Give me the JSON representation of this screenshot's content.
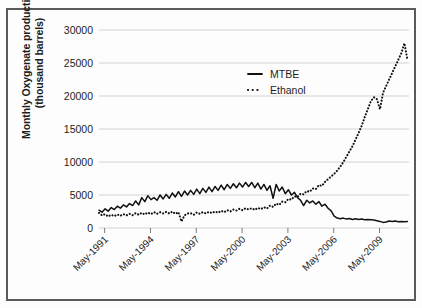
{
  "chart_data": {
    "type": "line",
    "title": "",
    "xlabel": "",
    "ylabel": "Monthly Oxygenate production",
    "ylabel_line2": "(thousand barrels)",
    "ylim": [
      0,
      30000
    ],
    "ytick_labels": [
      "30000",
      "25000",
      "20000",
      "15000",
      "10000",
      "5000",
      "0"
    ],
    "ytick_values": [
      30000,
      25000,
      20000,
      15000,
      10000,
      5000,
      0
    ],
    "xtick_labels": [
      "May-1991",
      "May-1994",
      "May-1997",
      "May-2000",
      "May-2003",
      "May-2006",
      "May-2009"
    ],
    "xtick_values": [
      1991.37,
      1994.37,
      1997.37,
      2000.37,
      2003.37,
      2006.37,
      2009.37
    ],
    "xlim": [
      1991.0,
      2011.3
    ],
    "grid": "horizontal",
    "legend_position": "top-center-right",
    "legend": [
      {
        "name": "MTBE",
        "style": "solid"
      },
      {
        "name": "Ethanol",
        "style": "dotted"
      }
    ],
    "series": [
      {
        "name": "MTBE",
        "style": "solid",
        "color": "#111111",
        "x": [
          1991.0,
          1991.2,
          1991.4,
          1991.6,
          1991.8,
          1992.0,
          1992.2,
          1992.4,
          1992.6,
          1992.8,
          1993.0,
          1993.2,
          1993.4,
          1993.6,
          1993.8,
          1994.0,
          1994.2,
          1994.4,
          1994.6,
          1994.8,
          1995.0,
          1995.2,
          1995.4,
          1995.6,
          1995.8,
          1996.0,
          1996.2,
          1996.4,
          1996.6,
          1996.8,
          1997.0,
          1997.2,
          1997.4,
          1997.6,
          1997.8,
          1998.0,
          1998.2,
          1998.4,
          1998.6,
          1998.8,
          1999.0,
          1999.2,
          1999.4,
          1999.6,
          1999.8,
          2000.0,
          2000.2,
          2000.4,
          2000.6,
          2000.8,
          2001.0,
          2001.2,
          2001.4,
          2001.6,
          2001.8,
          2002.0,
          2002.2,
          2002.4,
          2002.6,
          2002.8,
          2003.0,
          2003.2,
          2003.4,
          2003.6,
          2003.8,
          2004.0,
          2004.2,
          2004.4,
          2004.6,
          2004.8,
          2005.0,
          2005.2,
          2005.4,
          2005.6,
          2005.8,
          2006.0,
          2006.2,
          2006.4,
          2006.6,
          2006.8,
          2007.0,
          2007.2,
          2007.4,
          2007.6,
          2007.8,
          2008.0,
          2008.2,
          2008.4,
          2008.6,
          2008.8,
          2009.0,
          2009.2,
          2009.4,
          2009.6,
          2009.8,
          2010.0,
          2010.2,
          2010.4,
          2010.6,
          2010.8,
          2011.0,
          2011.2
        ],
        "values": [
          2700,
          2400,
          2900,
          2550,
          3100,
          2800,
          3300,
          3000,
          3500,
          3200,
          3700,
          3400,
          4100,
          3500,
          4600,
          4000,
          4900,
          4300,
          4600,
          4200,
          5000,
          4400,
          5100,
          4500,
          5300,
          4700,
          5500,
          4800,
          5600,
          5000,
          5700,
          5100,
          5900,
          5200,
          6000,
          5400,
          6200,
          5500,
          6300,
          5700,
          6500,
          5800,
          6600,
          6000,
          6700,
          6100,
          6800,
          6200,
          6900,
          6300,
          6900,
          6100,
          6800,
          5900,
          6600,
          5700,
          6400,
          4500,
          6600,
          5600,
          6200,
          5200,
          5800,
          5000,
          5400,
          4600,
          4200,
          3400,
          4200,
          3800,
          4100,
          3600,
          4000,
          3300,
          3600,
          3000,
          2600,
          1800,
          1500,
          1400,
          1500,
          1350,
          1450,
          1300,
          1400,
          1300,
          1350,
          1250,
          1300,
          1250,
          1200,
          1100,
          1000,
          850,
          900,
          1050,
          1000,
          1050,
          950,
          1000,
          950,
          1000
        ]
      },
      {
        "name": "Ethanol",
        "style": "dotted",
        "color": "#111111",
        "x": [
          1991.0,
          1991.2,
          1991.4,
          1991.6,
          1991.8,
          1992.0,
          1992.2,
          1992.4,
          1992.6,
          1992.8,
          1993.0,
          1993.2,
          1993.4,
          1993.6,
          1993.8,
          1994.0,
          1994.2,
          1994.4,
          1994.6,
          1994.8,
          1995.0,
          1995.2,
          1995.4,
          1995.6,
          1995.8,
          1996.0,
          1996.2,
          1996.4,
          1996.6,
          1996.8,
          1997.0,
          1997.2,
          1997.4,
          1997.6,
          1997.8,
          1998.0,
          1998.2,
          1998.4,
          1998.6,
          1998.8,
          1999.0,
          1999.2,
          1999.4,
          1999.6,
          1999.8,
          2000.0,
          2000.2,
          2000.4,
          2000.6,
          2000.8,
          2001.0,
          2001.2,
          2001.4,
          2001.6,
          2001.8,
          2002.0,
          2002.2,
          2002.4,
          2002.6,
          2002.8,
          2003.0,
          2003.2,
          2003.4,
          2003.6,
          2003.8,
          2004.0,
          2004.2,
          2004.4,
          2004.6,
          2004.8,
          2005.0,
          2005.2,
          2005.4,
          2005.6,
          2005.8,
          2006.0,
          2006.2,
          2006.4,
          2006.6,
          2006.8,
          2007.0,
          2007.2,
          2007.4,
          2007.6,
          2007.8,
          2008.0,
          2008.2,
          2008.4,
          2008.6,
          2008.8,
          2009.0,
          2009.2,
          2009.4,
          2009.6,
          2009.8,
          2010.0,
          2010.2,
          2010.4,
          2010.6,
          2010.8,
          2011.0,
          2011.2
        ],
        "values": [
          2300,
          1900,
          2100,
          1750,
          2000,
          1800,
          2050,
          1850,
          2100,
          1900,
          2150,
          1950,
          2250,
          2000,
          2300,
          2050,
          2350,
          2100,
          2400,
          2150,
          2400,
          2200,
          2450,
          2200,
          2500,
          2150,
          2400,
          1000,
          1900,
          2200,
          2250,
          2000,
          2350,
          2150,
          2400,
          2200,
          2450,
          2250,
          2500,
          2300,
          2600,
          2400,
          2700,
          2500,
          2800,
          2650,
          2900,
          2700,
          3000,
          2800,
          3000,
          2750,
          3050,
          2850,
          3150,
          2950,
          3400,
          3200,
          3700,
          3500,
          4000,
          3900,
          4400,
          4300,
          4800,
          4700,
          5200,
          5100,
          5600,
          5500,
          6000,
          5900,
          6500,
          6400,
          7000,
          7400,
          7800,
          8200,
          8700,
          9300,
          10000,
          10800,
          11600,
          12400,
          13400,
          14400,
          15500,
          16800,
          18000,
          19200,
          19800,
          19500,
          18000,
          20500,
          21500,
          22500,
          23500,
          24500,
          25500,
          26500,
          28000,
          25500
        ]
      }
    ]
  }
}
